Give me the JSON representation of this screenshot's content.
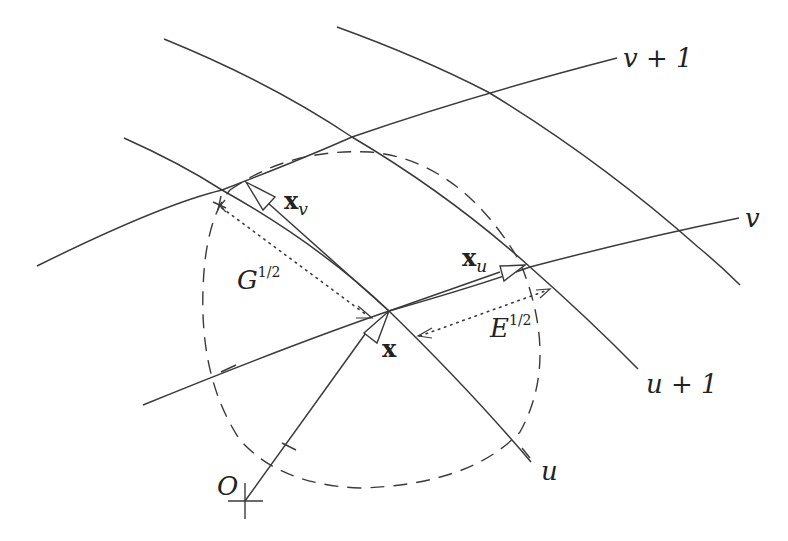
{
  "figure": {
    "labels": {
      "v_plus_1": "v + 1",
      "v": "v",
      "u_plus_1": "u + 1",
      "u": "u",
      "origin": "O",
      "point_x": "x",
      "xv_base": "x",
      "xv_sub": "v",
      "xu_base": "x",
      "xu_sub": "u",
      "G_base": "G",
      "G_sup": "1/2",
      "E_base": "E",
      "E_sup": "1/2"
    },
    "elements": {
      "curves": [
        "v+1 curve",
        "v curve",
        "u curve",
        "u+1 curve",
        "u+2 curve"
      ],
      "vectors": [
        "position vector x from O",
        "tangent vector x_u",
        "tangent vector x_v"
      ],
      "measures": [
        "G^(1/2) dotted distance",
        "E^(1/2) dotted distance"
      ],
      "circle": "dashed unit circle centred at x"
    },
    "colors": {
      "stroke": "#3a3a3a",
      "background": "#ffffff",
      "text": "#222222"
    }
  }
}
